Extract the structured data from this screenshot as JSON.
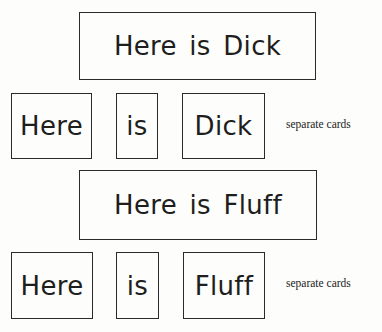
{
  "groups": [
    {
      "sentence": "Here is Dick",
      "cards": [
        "Here",
        "is",
        "Dick"
      ],
      "note": "separate cards"
    },
    {
      "sentence": "Here is Fluff",
      "cards": [
        "Here",
        "is",
        "Fluff"
      ],
      "note": "separate cards"
    }
  ]
}
